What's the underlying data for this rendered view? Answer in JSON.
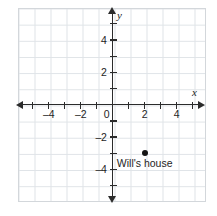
{
  "chart_data": {
    "type": "scatter",
    "title": "",
    "xlabel": "x",
    "ylabel": "y",
    "xlim": [
      -6,
      6
    ],
    "ylim": [
      -6,
      6
    ],
    "grid": true,
    "grid_spacing": 1,
    "legend": "none",
    "x_ticks": [
      -4,
      -2,
      0,
      2,
      4
    ],
    "x_tick_labels": [
      "–4",
      "–2",
      "0",
      "2",
      "4"
    ],
    "y_ticks": [
      4,
      2,
      -2,
      -4
    ],
    "y_tick_labels": [
      "4",
      "2",
      "–2",
      "–4"
    ],
    "points": [
      {
        "label": "Will's house",
        "x": 2,
        "y": -3
      }
    ],
    "annotations": [
      {
        "text": "Will's house",
        "x": 2,
        "y": -3.6
      }
    ],
    "colors": {
      "point": "#141414",
      "axis": "#2b2b2b",
      "grid": "#dfe3e7",
      "grid_border": "#d3d7db",
      "background": "#ffffff",
      "text": "#1e1e1e"
    }
  },
  "axes": {
    "x_name": "x",
    "y_name": "y"
  },
  "icons": {
    "x_arrow_left": "arrow-left-icon",
    "x_arrow_right": "arrow-right-icon",
    "y_arrow_top": "arrow-up-icon",
    "y_arrow_bottom": "arrow-down-icon"
  }
}
